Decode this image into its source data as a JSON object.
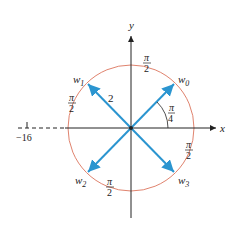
{
  "diagram": {
    "axes": {
      "x_label": "x",
      "y_label": "y",
      "tick_label": "−16"
    },
    "roots": [
      {
        "label": "w",
        "sub": "0"
      },
      {
        "label": "w",
        "sub": "1"
      },
      {
        "label": "w",
        "sub": "2"
      },
      {
        "label": "w",
        "sub": "3"
      }
    ],
    "radius_label": "2",
    "angle_label": {
      "num": "π",
      "den": "4"
    },
    "arc_labels": [
      {
        "num": "π",
        "den": "2"
      },
      {
        "num": "π",
        "den": "2"
      },
      {
        "num": "π",
        "den": "2"
      },
      {
        "num": "π",
        "den": "2"
      }
    ],
    "colors": {
      "vector": "#2b95d0",
      "circle": "#e0836e",
      "axis": "#222222"
    }
  }
}
